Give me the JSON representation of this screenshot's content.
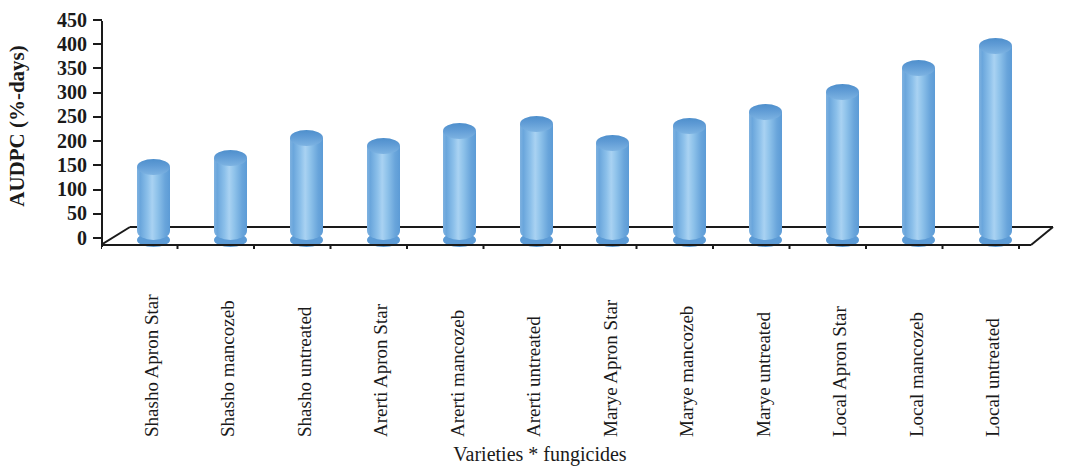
{
  "chart_data": {
    "type": "bar",
    "title": "",
    "xlabel": "Varieties * fungicides",
    "ylabel": "AUDPC (%-days)",
    "ylim": [
      0,
      450
    ],
    "yticks": [
      450,
      400,
      350,
      300,
      250,
      200,
      150,
      100,
      50,
      0
    ],
    "grid": false,
    "legend": "none",
    "style": "3d-cylinder",
    "series_color": "#5c9bd6",
    "categories": [
      "Shasho Apron Star",
      "Shasho mancozeb",
      "Shasho untreated",
      "Arerti Apron Star",
      "Arerti mancozeb",
      "Arerti untreated",
      "Marye Apron Star",
      "Marye mancozeb",
      "Marye untreated",
      "Local Apron Star",
      "Local mancozeb",
      "Local untreated"
    ],
    "values": [
      150,
      170,
      210,
      195,
      225,
      240,
      200,
      235,
      265,
      305,
      355,
      400
    ]
  }
}
